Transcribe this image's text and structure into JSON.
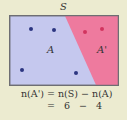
{
  "diagram": {
    "universal_set_label": "S",
    "set_a_label": "A",
    "complement_label": "A'",
    "colors": {
      "background": "#ecebd0",
      "set_a_fill": "#c5c8ee",
      "complement_fill": "#ee7a9e",
      "border": "#6e6e73",
      "set_a_dot": "#2c3580",
      "complement_dot": "#d1345f"
    },
    "set_a_points": 4,
    "complement_points": 2
  },
  "formula": {
    "line1": "n(A') = n(S) − n(A)",
    "line2": "= 6 − 4"
  }
}
